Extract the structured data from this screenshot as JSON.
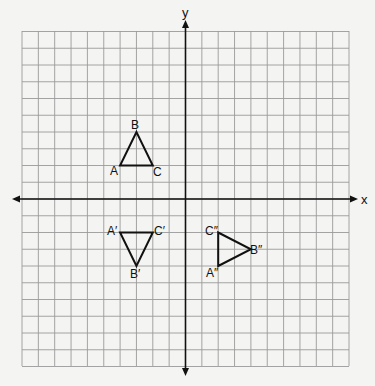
{
  "diagram": {
    "type": "coordinate-plane-transformations",
    "grid": {
      "xmin": -10,
      "xmax": 10,
      "ymin": -10,
      "ymax": 10,
      "step": 1
    },
    "axes": {
      "x_label": "x",
      "y_label": "y"
    },
    "colors": {
      "grid": "#9a9a9a",
      "axis": "#111111",
      "shape": "#111111",
      "background": "#f4f4f2"
    },
    "shapes": [
      {
        "name": "triangle-ABC",
        "vertices": [
          {
            "label": "A",
            "x": -4,
            "y": 2
          },
          {
            "label": "B",
            "x": -3,
            "y": 4
          },
          {
            "label": "C",
            "x": -2,
            "y": 2
          }
        ]
      },
      {
        "name": "triangle-A-prime-B-prime-C-prime",
        "vertices": [
          {
            "label": "A′",
            "x": -4,
            "y": -2
          },
          {
            "label": "B′",
            "x": -3,
            "y": -4
          },
          {
            "label": "C′",
            "x": -2,
            "y": -2
          }
        ]
      },
      {
        "name": "triangle-A-dprime-B-dprime-C-dprime",
        "vertices": [
          {
            "label": "A″",
            "x": 2,
            "y": -4
          },
          {
            "label": "B″",
            "x": 4,
            "y": -3
          },
          {
            "label": "C″",
            "x": 2,
            "y": -2
          }
        ]
      }
    ]
  },
  "labels": {
    "x_axis": "x",
    "y_axis": "y",
    "A": "A",
    "B": "B",
    "C": "C",
    "A1": "A′",
    "B1": "B′",
    "C1": "C′",
    "A2": "A″",
    "B2": "B″",
    "C2": "C″"
  }
}
